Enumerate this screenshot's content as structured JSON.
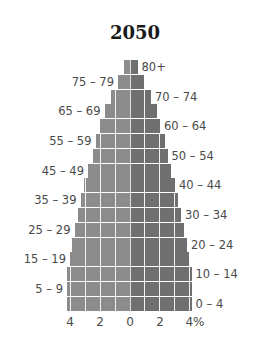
{
  "chart_data": {
    "type": "bar",
    "subtype": "population-pyramid",
    "title": "2050",
    "xlabel": "",
    "ylabel": "",
    "x_tick_labels": [
      "4",
      "2",
      "0",
      "2",
      "4%"
    ],
    "xlim": [
      -4.5,
      4.5
    ],
    "grid": true,
    "categories": [
      "80+",
      "75 – 79",
      "70 – 74",
      "65 – 69",
      "60 – 64",
      "55 – 59",
      "50 – 54",
      "45 – 49",
      "40 – 44",
      "35 – 39",
      "30 – 34",
      "25 – 29",
      "20 – 24",
      "15 – 19",
      "10 – 14",
      "5 – 9",
      "0 – 4"
    ],
    "series": [
      {
        "name": "Left (male)",
        "color": "#8c8c8c",
        "values": [
          0.4,
          0.8,
          1.3,
          1.7,
          2.0,
          2.3,
          2.5,
          2.8,
          3.1,
          3.3,
          3.5,
          3.7,
          3.9,
          4.0,
          4.2,
          4.2,
          4.2
        ]
      },
      {
        "name": "Right (female)",
        "color": "#6f6f6f",
        "values": [
          0.5,
          0.9,
          1.4,
          1.8,
          2.0,
          2.3,
          2.5,
          2.7,
          3.0,
          3.2,
          3.4,
          3.6,
          3.8,
          3.9,
          4.1,
          4.1,
          4.1
        ]
      }
    ],
    "label_side": [
      "right",
      "left",
      "right",
      "left",
      "right",
      "left",
      "right",
      "left",
      "right",
      "left",
      "right",
      "left",
      "right",
      "left",
      "right",
      "left",
      "right"
    ]
  }
}
